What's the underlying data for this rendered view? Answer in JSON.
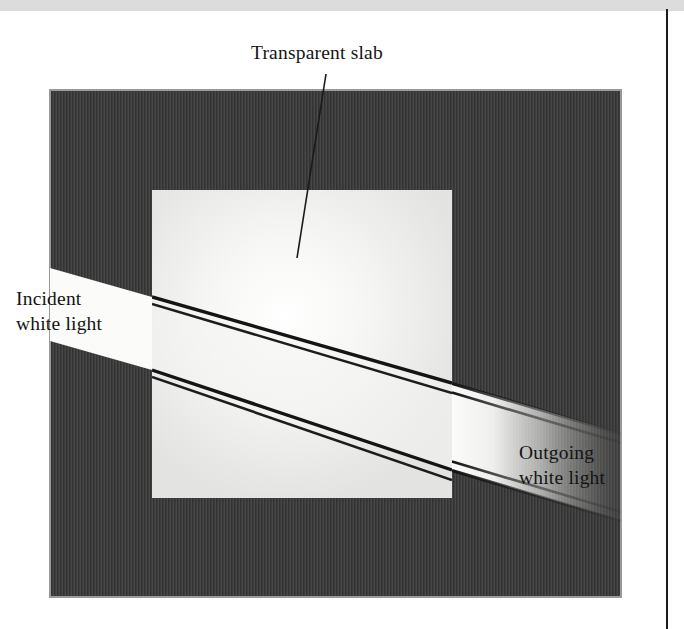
{
  "figure": {
    "labels": {
      "transparent_slab": "Transparent slab",
      "incident_white_light": "Incident\nwhite light",
      "outgoing_white_light": "Outgoing\nwhite light"
    },
    "colors": {
      "page_background": "#ffffff",
      "top_band": "#dcdcdc",
      "margin_rule": "#1b1b1b",
      "dark_field": "#3c3c3c",
      "dark_field_border": "#9a9a9a",
      "slab_fill": "#e9e9e7",
      "slab_glow": "#ffffff",
      "beam_white": "#fbfbfa",
      "ray_line": "#141414",
      "leader_line": "#1a1a1a",
      "text": "#141414"
    },
    "geometry": {
      "dark_field": {
        "x": 50,
        "y": 90,
        "width": 571,
        "height": 507
      },
      "slab": {
        "x": 152,
        "y": 190,
        "width": 300,
        "height": 308
      },
      "incident_beam": {
        "entry_left_top": [
          50,
          268
        ],
        "entry_left_bottom": [
          50,
          341
        ],
        "slab_face_top": [
          152,
          297
        ],
        "slab_face_bottom": [
          152,
          370
        ]
      },
      "refracted_beam": {
        "exit_face_top": [
          452,
          383
        ],
        "exit_face_bottom": [
          452,
          470
        ]
      },
      "outgoing_beam": {
        "fade_end_x": 621,
        "top_end": [
          621,
          425
        ],
        "bottom_end": [
          621,
          512
        ]
      },
      "leader_line": {
        "from": [
          326,
          74
        ],
        "to": [
          297,
          258
        ]
      }
    }
  }
}
